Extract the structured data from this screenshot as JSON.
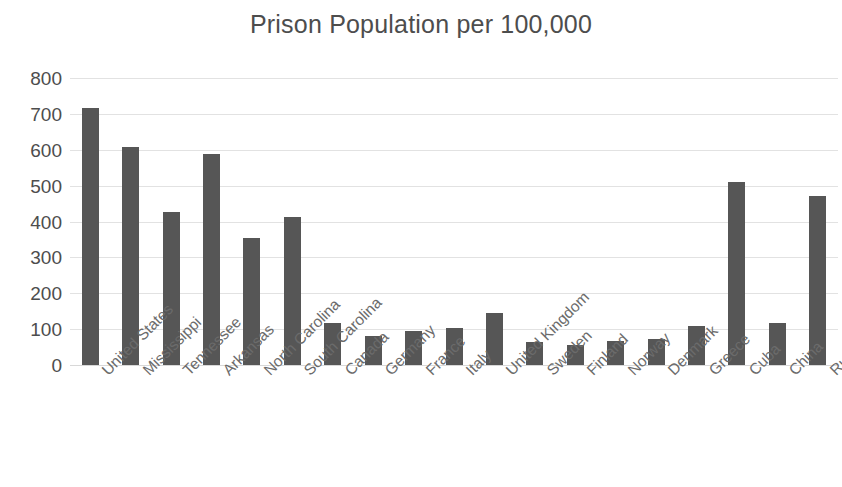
{
  "chart_data": {
    "type": "bar",
    "title": "Prison Population per 100,000",
    "xlabel": "",
    "ylabel": "",
    "ylim": [
      0,
      800
    ],
    "ytick_step": 100,
    "yticks": [
      "800",
      "700",
      "600",
      "500",
      "400",
      "300",
      "200",
      "100",
      "0"
    ],
    "grid": true,
    "legend": "none",
    "bar_color": "#565656",
    "gridline_color": "#e2e2e2",
    "title_color": "#4d4d4d",
    "label_color": "#6b6b6b",
    "categories": [
      "United States",
      "Mississippi",
      "Tennessee",
      "Arkansas",
      "North Carolina",
      "South Carolina",
      "Canada",
      "Germany",
      "France",
      "Italy",
      "United Kingdom",
      "Sweden",
      "Finland",
      "Norway",
      "Denmark",
      "Greece",
      "Cuba",
      "China",
      "Russia"
    ],
    "values": [
      716,
      607,
      426,
      589,
      353,
      413,
      118,
      81,
      96,
      104,
      146,
      64,
      56,
      68,
      72,
      109,
      510,
      118,
      470
    ]
  }
}
